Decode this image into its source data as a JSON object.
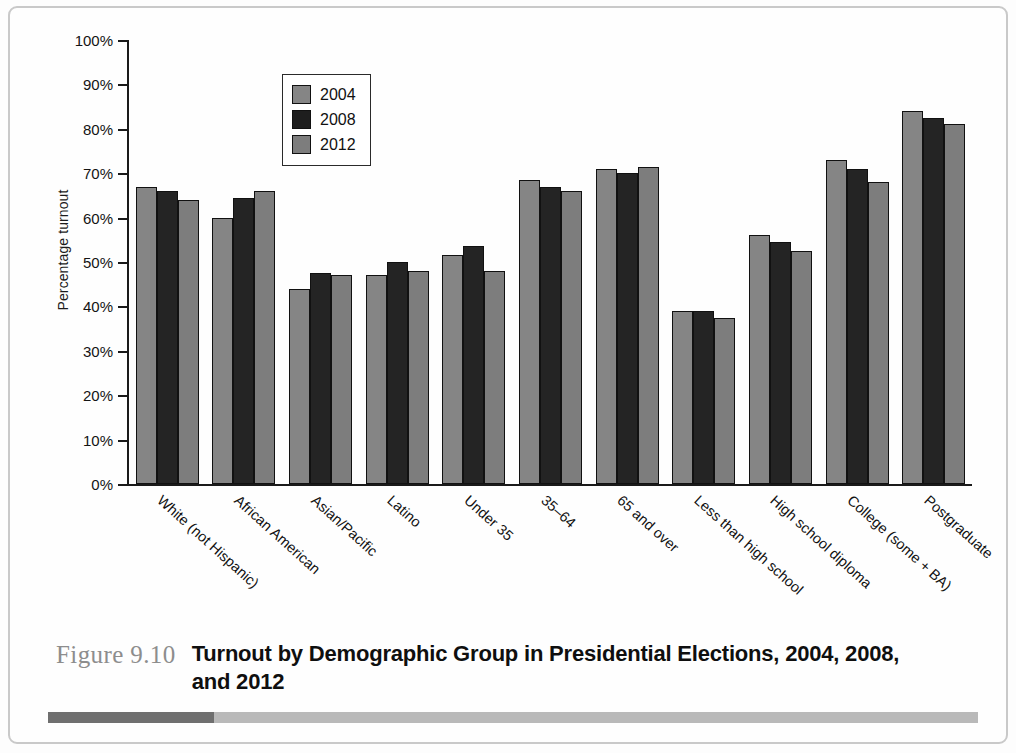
{
  "figure": {
    "number": "Figure 9.10",
    "title": "Turnout by Demographic Group in Presidential Elections, 2004, 2008, and 2012",
    "rule_dark_color": "#6f6f6f",
    "rule_light_color": "#b9b9b9"
  },
  "legend": {
    "position": "top-left-inside-plot",
    "entries": [
      {
        "label": "2004",
        "color": "#858585"
      },
      {
        "label": "2008",
        "color": "#1e1e1e"
      },
      {
        "label": "2012",
        "color": "#7d7d7d"
      }
    ]
  },
  "axis": {
    "y_title": "Percentage turnout",
    "y_ticks": [
      "100%",
      "90%",
      "80%",
      "70%",
      "60%",
      "50%",
      "40%",
      "30%",
      "20%",
      "10%",
      "0%"
    ]
  },
  "chart_data": {
    "type": "bar",
    "title": "Turnout by Demographic Group in Presidential Elections, 2004, 2008, and 2012",
    "xlabel": "",
    "ylabel": "Percentage turnout",
    "ylim": [
      0,
      100
    ],
    "ytick_step": 10,
    "grid": false,
    "legend_position": "upper left",
    "categories": [
      "White (not Hispanic)",
      "African American",
      "Asian/Pacific",
      "Latino",
      "Under 35",
      "35–64",
      "65 and over",
      "Less than high school",
      "High school diploma",
      "College (some + BA)",
      "Postgraduate"
    ],
    "series": [
      {
        "name": "2004",
        "color": "#858585",
        "values": [
          67,
          60,
          44,
          47,
          51.5,
          68.5,
          71,
          39,
          56,
          73,
          84
        ]
      },
      {
        "name": "2008",
        "color": "#242424",
        "values": [
          66,
          64.5,
          47.5,
          50,
          53.5,
          67,
          70,
          39,
          54.5,
          71,
          82.5
        ]
      },
      {
        "name": "2012",
        "color": "#7d7d7d",
        "values": [
          64,
          66,
          47,
          48,
          48,
          66,
          71.5,
          37.5,
          52.5,
          68,
          81
        ]
      }
    ]
  }
}
